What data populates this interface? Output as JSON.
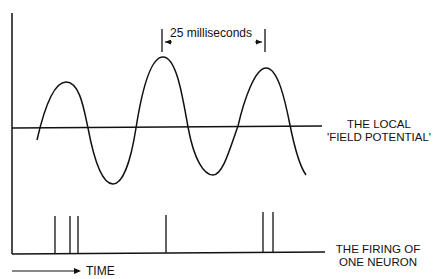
{
  "diagram": {
    "interval_label": "25 milliseconds",
    "field_label_line1": "THE LOCAL",
    "field_label_line2": "'FIELD POTENTIAL'",
    "firing_label_line1": "THE FIRING OF",
    "firing_label_line2": "ONE NEURON",
    "time_label": "TIME",
    "stroke_color": "#111111",
    "background_color": "#ffffff",
    "spike_x_positions": [
      55,
      70,
      78,
      166,
      263,
      273
    ]
  }
}
